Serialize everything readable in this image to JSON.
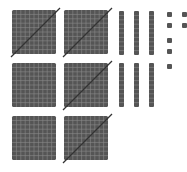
{
  "colors": {
    "block_fill": "#555555",
    "grid_line": "#8a8a8a",
    "slash": "#333333",
    "background": "#ffffff"
  },
  "blocks": {
    "hundreds": [
      {
        "crossed": true
      },
      {
        "crossed": true
      },
      {
        "crossed": false
      },
      {
        "crossed": true
      },
      {
        "crossed": false
      },
      {
        "crossed": true
      }
    ],
    "tens": [
      {
        "crossed": false
      },
      {
        "crossed": false
      },
      {
        "crossed": false
      },
      {
        "crossed": false
      },
      {
        "crossed": false
      },
      {
        "crossed": false
      }
    ],
    "ones": [
      {
        "crossed": false
      },
      {
        "crossed": false
      },
      {
        "crossed": false
      },
      {
        "crossed": false
      },
      {
        "crossed": false
      },
      {
        "crossed": false
      },
      {
        "crossed": false
      }
    ]
  },
  "counts": {
    "hundreds": 6,
    "tens": 6,
    "ones": 7
  }
}
